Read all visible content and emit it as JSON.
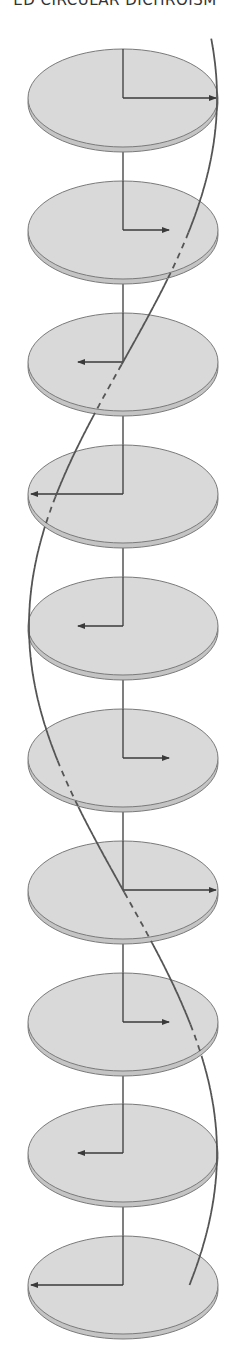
{
  "header": {
    "title": "ED CIRCULAR DICHROISM"
  },
  "figure": {
    "width": 230,
    "height": 1363,
    "axis_x": 123,
    "disc": {
      "rx": 95,
      "ry": 49,
      "thickness": 5,
      "fill": "#d9d9d9",
      "rim_fill": "#c4c4c4",
      "outline": "#7a7a7a"
    },
    "colors": {
      "axis": "#3a3a3a",
      "arrow": "#3a3a3a",
      "helix": "#555555"
    },
    "discs": [
      {
        "index": 1,
        "cy": 98,
        "arrow_tip_x": 217,
        "direction": "right"
      },
      {
        "index": 2,
        "cy": 230,
        "arrow_tip_x": 170,
        "direction": "right"
      },
      {
        "index": 3,
        "cy": 362,
        "arrow_tip_x": 77,
        "direction": "left"
      },
      {
        "index": 4,
        "cy": 494,
        "arrow_tip_x": 30,
        "direction": "left"
      },
      {
        "index": 5,
        "cy": 626,
        "arrow_tip_x": 77,
        "direction": "left"
      },
      {
        "index": 6,
        "cy": 758,
        "arrow_tip_x": 170,
        "direction": "right"
      },
      {
        "index": 7,
        "cy": 890,
        "arrow_tip_x": 217,
        "direction": "right"
      },
      {
        "index": 8,
        "cy": 1022,
        "arrow_tip_x": 170,
        "direction": "right"
      },
      {
        "index": 9,
        "cy": 1153,
        "arrow_tip_x": 77,
        "direction": "left"
      },
      {
        "index": 10,
        "cy": 1285,
        "arrow_tip_x": 30,
        "direction": "left"
      }
    ],
    "helix": {
      "description": "Curve tracing the tips of the rotating field vectors; dashed where it passes behind a disc",
      "degrees_per_disc": 45,
      "amplitude": 94
    }
  }
}
